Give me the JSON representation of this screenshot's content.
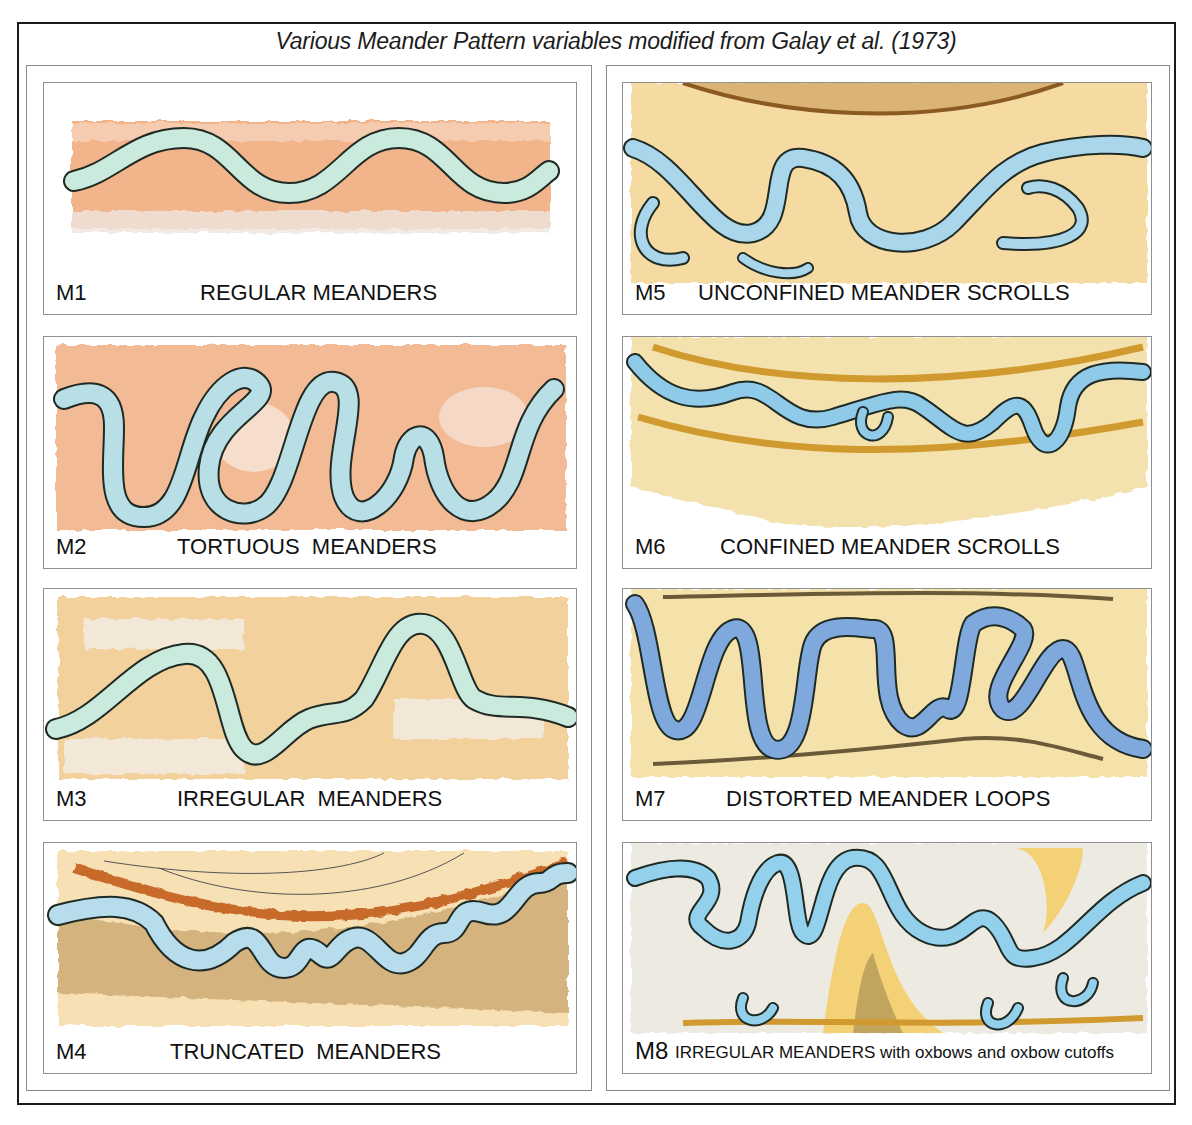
{
  "title": "Various Meander Pattern variables modified from Galay et al. (1973)",
  "colors": {
    "water_green": "#c9eadc",
    "water_blue": "#a9d6ea",
    "water_deep_blue": "#7fa9dc",
    "bank_orange": "#f0a877",
    "bank_tan": "#f2cf8a",
    "bank_yellow": "#f4d98e",
    "outline": "#1f2a24",
    "terrace_brown": "#c86a2a"
  },
  "panels": [
    {
      "code": "M1",
      "name": "REGULAR MEANDERS",
      "column": "left"
    },
    {
      "code": "M2",
      "name": "TORTUOUS  MEANDERS",
      "column": "left"
    },
    {
      "code": "M3",
      "name": "IRREGULAR  MEANDERS",
      "column": "left"
    },
    {
      "code": "M4",
      "name": "TRUNCATED  MEANDERS",
      "column": "left"
    },
    {
      "code": "M5",
      "name": "UNCONFINED MEANDER SCROLLS",
      "column": "right"
    },
    {
      "code": "M6",
      "name": "CONFINED MEANDER SCROLLS",
      "column": "right"
    },
    {
      "code": "M7",
      "name": "DISTORTED MEANDER LOOPS",
      "column": "right"
    },
    {
      "code": "M8",
      "name_main": "IRREGULAR MEANDERS",
      "name_suffix": " with oxbows and oxbow cutoffs",
      "column": "right"
    }
  ]
}
